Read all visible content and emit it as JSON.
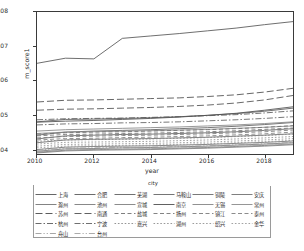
{
  "axes": {
    "ylabel": "m_score1",
    "xlabel": "year",
    "yticks": [
      "0.04",
      "0.05",
      "0.06",
      "0.07",
      "0.08"
    ],
    "xticks": [
      "2010",
      "2012",
      "2014",
      "2016",
      "2018"
    ]
  },
  "legend": {
    "title": "city"
  },
  "chart_data": {
    "type": "line",
    "title": "",
    "xlabel": "year",
    "ylabel": "m_score1",
    "xlim": [
      2010,
      2019
    ],
    "ylim": [
      0.0385,
      0.08
    ],
    "grid": false,
    "legend_position": "below",
    "legend_title": "city",
    "x": [
      2010,
      2011,
      2012,
      2013,
      2014,
      2015,
      2016,
      2017,
      2018,
      2019
    ],
    "series": [
      {
        "name": "上海",
        "style": "solid",
        "color": "#555555",
        "values": [
          0.065,
          0.0665,
          0.0663,
          0.0723,
          0.073,
          0.0737,
          0.0745,
          0.0753,
          0.0763,
          0.0772
        ]
      },
      {
        "name": "合肥",
        "style": "solid",
        "color": "#5a5a5a",
        "values": [
          0.0479,
          0.0486,
          0.0487,
          0.0489,
          0.0491,
          0.0494,
          0.0498,
          0.0503,
          0.051,
          0.0519
        ]
      },
      {
        "name": "芜湖",
        "style": "solid",
        "color": "#606060",
        "values": [
          0.044,
          0.0449,
          0.0452,
          0.0454,
          0.0456,
          0.0459,
          0.0462,
          0.0466,
          0.0471,
          0.0477
        ]
      },
      {
        "name": "马鞍山",
        "style": "solid",
        "color": "#656565",
        "values": [
          0.0429,
          0.0438,
          0.044,
          0.0442,
          0.0443,
          0.0445,
          0.0447,
          0.045,
          0.0454,
          0.0459
        ]
      },
      {
        "name": "铜陵",
        "style": "solid",
        "color": "#6a6a6a",
        "values": [
          0.0418,
          0.0426,
          0.0428,
          0.0429,
          0.043,
          0.0432,
          0.0434,
          0.0437,
          0.044,
          0.0444
        ]
      },
      {
        "name": "安庆",
        "style": "solid",
        "color": "#707070",
        "values": [
          0.0398,
          0.0405,
          0.0407,
          0.0408,
          0.0409,
          0.0411,
          0.0413,
          0.0416,
          0.0419,
          0.0423
        ]
      },
      {
        "name": "滁州",
        "style": "solid",
        "color": "#757575",
        "values": [
          0.0393,
          0.04,
          0.0401,
          0.0403,
          0.0404,
          0.0406,
          0.0408,
          0.0411,
          0.0414,
          0.0418
        ]
      },
      {
        "name": "池州",
        "style": "solid",
        "color": "#7a7a7a",
        "values": [
          0.039,
          0.0396,
          0.0398,
          0.0399,
          0.04,
          0.0402,
          0.0404,
          0.0407,
          0.041,
          0.0414
        ]
      },
      {
        "name": "宣城",
        "style": "solid",
        "color": "#7f7f7f",
        "values": [
          0.0388,
          0.0394,
          0.0396,
          0.0397,
          0.0398,
          0.04,
          0.0402,
          0.0405,
          0.0408,
          0.0412
        ]
      },
      {
        "name": "南京",
        "style": "solid",
        "color": "#4f4f4f",
        "values": [
          0.0478,
          0.0481,
          0.0483,
          0.0486,
          0.0489,
          0.0493,
          0.0498,
          0.0504,
          0.0513,
          0.0523
        ]
      },
      {
        "name": "无锡",
        "style": "solid",
        "color": "#858585",
        "values": [
          0.0452,
          0.0456,
          0.0458,
          0.046,
          0.0462,
          0.0464,
          0.0467,
          0.047,
          0.0474,
          0.0479
        ]
      },
      {
        "name": "常州",
        "style": "solid",
        "color": "#8a8a8a",
        "values": [
          0.0445,
          0.0449,
          0.045,
          0.0452,
          0.0453,
          0.0455,
          0.0457,
          0.046,
          0.0463,
          0.0467
        ]
      },
      {
        "name": "苏州",
        "style": "dashed-long",
        "color": "#4a4a4a",
        "values": [
          0.0537,
          0.0542,
          0.0543,
          0.0545,
          0.0547,
          0.0549,
          0.0553,
          0.0558,
          0.0566,
          0.0577
        ]
      },
      {
        "name": "南通",
        "style": "dashed-long",
        "color": "#4f4f4f",
        "values": [
          0.0513,
          0.0516,
          0.0517,
          0.0519,
          0.0521,
          0.0524,
          0.0528,
          0.0534,
          0.0543,
          0.0556
        ]
      },
      {
        "name": "盐城",
        "style": "dashed",
        "color": "#707070",
        "values": [
          0.0443,
          0.0447,
          0.0449,
          0.045,
          0.0452,
          0.0454,
          0.0456,
          0.0459,
          0.0463,
          0.0468
        ]
      },
      {
        "name": "扬州",
        "style": "dashed",
        "color": "#757575",
        "values": [
          0.0438,
          0.0442,
          0.0443,
          0.0445,
          0.0446,
          0.0448,
          0.045,
          0.0453,
          0.0457,
          0.0461
        ]
      },
      {
        "name": "镇江",
        "style": "dashed",
        "color": "#7a7a7a",
        "values": [
          0.0432,
          0.0436,
          0.0437,
          0.0439,
          0.044,
          0.0442,
          0.0444,
          0.0447,
          0.045,
          0.0455
        ]
      },
      {
        "name": "泰州",
        "style": "dashed",
        "color": "#7f7f7f",
        "values": [
          0.0426,
          0.043,
          0.0431,
          0.0433,
          0.0434,
          0.0436,
          0.0438,
          0.0441,
          0.0444,
          0.0449
        ]
      },
      {
        "name": "杭州",
        "style": "dashdot",
        "color": "#5a5a5a",
        "values": [
          0.0485,
          0.0488,
          0.0489,
          0.049,
          0.0492,
          0.0494,
          0.0497,
          0.05,
          0.0505,
          0.0511
        ]
      },
      {
        "name": "宁波",
        "style": "dashdot",
        "color": "#606060",
        "values": [
          0.047,
          0.0473,
          0.0474,
          0.0476,
          0.0477,
          0.0479,
          0.0482,
          0.0485,
          0.0489,
          0.0494
        ]
      },
      {
        "name": "嘉兴",
        "style": "dotted",
        "color": "#888888",
        "values": [
          0.0422,
          0.0426,
          0.0427,
          0.0428,
          0.0429,
          0.0431,
          0.0433,
          0.0436,
          0.0439,
          0.0443
        ]
      },
      {
        "name": "湖州",
        "style": "dotted",
        "color": "#8d8d8d",
        "values": [
          0.0414,
          0.0419,
          0.042,
          0.0421,
          0.0422,
          0.0424,
          0.0426,
          0.0429,
          0.0432,
          0.0436
        ]
      },
      {
        "name": "绍兴",
        "style": "dotted",
        "color": "#929292",
        "values": [
          0.0408,
          0.0413,
          0.0414,
          0.0415,
          0.0416,
          0.0418,
          0.042,
          0.0423,
          0.0426,
          0.043
        ]
      },
      {
        "name": "金华",
        "style": "dotted",
        "color": "#979797",
        "values": [
          0.0403,
          0.0408,
          0.0409,
          0.041,
          0.0411,
          0.0413,
          0.0415,
          0.0418,
          0.0421,
          0.0425
        ]
      },
      {
        "name": "舟山",
        "style": "dashdotdot",
        "color": "#9c9c9c",
        "values": [
          0.0396,
          0.0402,
          0.0403,
          0.0404,
          0.0405,
          0.0407,
          0.0409,
          0.0412,
          0.0415,
          0.0419
        ]
      },
      {
        "name": "台州",
        "style": "dashdotdot",
        "color": "#a1a1a1",
        "values": [
          0.0391,
          0.0397,
          0.0398,
          0.0399,
          0.04,
          0.0402,
          0.0404,
          0.0407,
          0.041,
          0.0414
        ]
      }
    ]
  }
}
